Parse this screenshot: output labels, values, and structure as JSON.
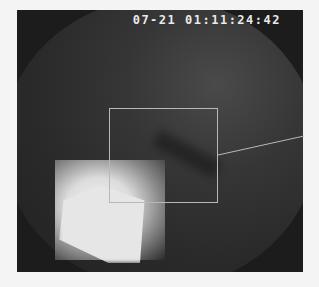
{
  "image": {
    "description": "Grayscale endoscopic view with timestamp overlay and region-of-interest annotation",
    "timestamp": "07-21 01:11:24:42",
    "annotation": {
      "type": "rectangle",
      "box": {
        "x": 109,
        "y": 108,
        "width": 109,
        "height": 95
      },
      "leader_line": {
        "x1": 218,
        "y1": 155,
        "x2": 304,
        "y2": 136
      },
      "color": "#b8b8b8"
    },
    "colors": {
      "frame": "#1c1c1c",
      "background": "#f4f4f4",
      "highlight": "#e6e6e6"
    }
  }
}
